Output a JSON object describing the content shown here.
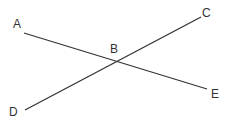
{
  "diagram": {
    "type": "intersecting-lines",
    "points": {
      "A": {
        "label": "A",
        "x": 24,
        "y": 33,
        "label_x": 13,
        "label_y": 28
      },
      "B": {
        "label": "B",
        "x": 117,
        "y": 61,
        "label_x": 110,
        "label_y": 53
      },
      "C": {
        "label": "C",
        "x": 201,
        "y": 17,
        "label_x": 202,
        "label_y": 17
      },
      "D": {
        "label": "D",
        "x": 25,
        "y": 110,
        "label_x": 9,
        "label_y": 116
      },
      "E": {
        "label": "E",
        "x": 207,
        "y": 89,
        "label_x": 211,
        "label_y": 98
      }
    },
    "segments": [
      {
        "from": "A",
        "to": "E"
      },
      {
        "from": "D",
        "to": "C"
      }
    ],
    "line_color": "#333333"
  }
}
